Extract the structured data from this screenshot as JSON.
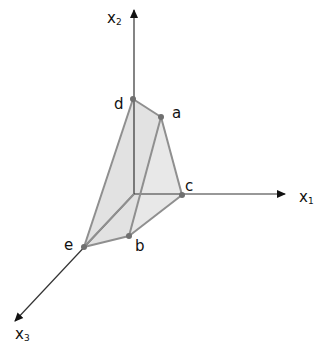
{
  "diagram": {
    "type": "3d-polytope",
    "axes": [
      {
        "id": "x1",
        "label": "x",
        "subscript": "1",
        "direction": "right"
      },
      {
        "id": "x2",
        "label": "x",
        "subscript": "2",
        "direction": "up"
      },
      {
        "id": "x3",
        "label": "x",
        "subscript": "3",
        "direction": "toward-viewer"
      }
    ],
    "vertices": [
      {
        "id": "a",
        "label": "a"
      },
      {
        "id": "b",
        "label": "b"
      },
      {
        "id": "c",
        "label": "c"
      },
      {
        "id": "d",
        "label": "d"
      },
      {
        "id": "e",
        "label": "e"
      }
    ],
    "edges": [
      [
        "d",
        "a"
      ],
      [
        "a",
        "c"
      ],
      [
        "c",
        "b"
      ],
      [
        "b",
        "e"
      ],
      [
        "e",
        "d"
      ],
      [
        "a",
        "b"
      ],
      [
        "e",
        "origin"
      ]
    ],
    "colors": {
      "edge": "#8a8a8a",
      "face_fill": "#e6e6e6",
      "axis": "#222222",
      "vertex": "#6e6e6e"
    }
  }
}
